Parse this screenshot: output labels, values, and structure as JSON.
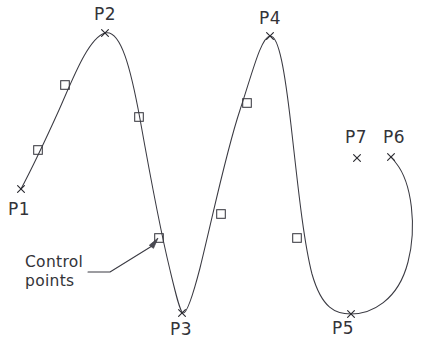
{
  "diagram": {
    "stroke_color": "#3a3a42",
    "text_color": "#333338",
    "background_color": "#ffffff",
    "width": 424,
    "height": 353
  },
  "annotation": {
    "line1": "Control",
    "line2": "points",
    "leader_from": [
      110,
      272
    ],
    "leader_to": [
      152,
      246
    ],
    "arrow_target": [
      158,
      238
    ]
  },
  "chart_data": {
    "type": "line",
    "xlabel": "",
    "ylabel": "",
    "grid": false,
    "legend": null,
    "xlim": [
      0,
      424
    ],
    "ylim": [
      353,
      0
    ],
    "annotations": [
      "Control points"
    ],
    "defining_points": {
      "names": [
        "P1",
        "P2",
        "P3",
        "P4",
        "P5",
        "P6",
        "P7"
      ],
      "x": [
        21,
        105,
        182,
        270,
        351,
        391,
        357
      ],
      "y": [
        189,
        33,
        313,
        36,
        314,
        157,
        158
      ],
      "marker": "x",
      "on_curve": [
        true,
        true,
        true,
        true,
        true,
        true,
        false
      ]
    },
    "control_points": {
      "x": [
        38,
        65,
        139,
        159,
        221,
        247,
        297
      ],
      "y": [
        150,
        85,
        117,
        238,
        214,
        103,
        238
      ],
      "marker": "square",
      "count": 7
    },
    "curve_path": "M 21 189 C 30 172 45 141 59 110 C 72 81 88 38 105 33 C 121 29 131 70 140 119 C 150 175 160 229 170 270 C 176 295 180 312 183 313 C 187 314 193 295 200 268 C 214 211 226 152 240 110 C 252 74 261 37 270 36 C 279 35 285 73 291 125 C 297 177 303 239 312 274 C 322 309 336 314 351 314 C 371 314 398 301 408 262 C 417 227 412 183 396 163 C 394 160 392 158 391 157",
    "point_labels": [
      {
        "text": "P1",
        "x": 8,
        "y": 201,
        "anchor": "below-left"
      },
      {
        "text": "P2",
        "x": 94,
        "y": 6,
        "anchor": "above"
      },
      {
        "text": "P3",
        "x": 170,
        "y": 321,
        "anchor": "below"
      },
      {
        "text": "P4",
        "x": 259,
        "y": 10,
        "anchor": "above"
      },
      {
        "text": "P5",
        "x": 332,
        "y": 320,
        "anchor": "below"
      },
      {
        "text": "P6",
        "x": 383,
        "y": 129,
        "anchor": "above"
      },
      {
        "text": "P7",
        "x": 345,
        "y": 129,
        "anchor": "above"
      }
    ]
  }
}
